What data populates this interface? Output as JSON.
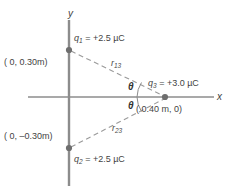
{
  "figure": {
    "type": "physics-force-diagram",
    "background": "#ffffff",
    "axis_color": "#8c8c8c",
    "dash_color": "#9a9a9a",
    "text_color": "#434343",
    "point_color": "#6e6e6e"
  },
  "axes": {
    "x_label": "x",
    "y_label": "y",
    "origin": {
      "x": 69,
      "y": 97
    }
  },
  "charges": [
    {
      "id": "q1",
      "label": "q",
      "subscript": "1",
      "value_text": "= +2.5 µC",
      "full_label": "q₁ = +2.5 µC",
      "coord_label": "( 0, 0.30m)",
      "px": {
        "x": 69,
        "y": 50
      }
    },
    {
      "id": "q2",
      "label": "q",
      "subscript": "2",
      "value_text": "= +2.5 µC",
      "full_label": "q₂ = +2.5 µC",
      "coord_label": "( 0, –0.30m)",
      "px": {
        "x": 69,
        "y": 148
      }
    },
    {
      "id": "q3",
      "label": "q",
      "subscript": "3",
      "value_text": "= +3.0 µC",
      "full_label": "q₃ = +3.0 µC",
      "coord_label": "( 0.40 m, 0)",
      "px": {
        "x": 165,
        "y": 97
      }
    }
  ],
  "distances": [
    {
      "id": "r13",
      "label": "r",
      "subscript": "13",
      "from": "q1",
      "to": "q3"
    },
    {
      "id": "r23",
      "label": "r",
      "subscript": "23",
      "from": "q2",
      "to": "q3"
    }
  ],
  "angles": [
    {
      "id": "theta-upper",
      "symbol": "θ"
    },
    {
      "id": "theta-lower",
      "symbol": "θ"
    }
  ]
}
